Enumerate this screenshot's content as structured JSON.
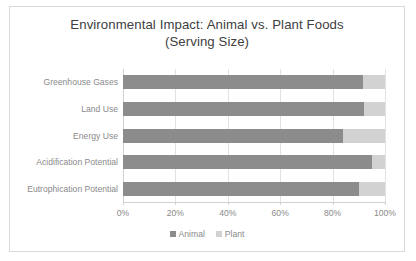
{
  "chart_data": {
    "type": "bar",
    "orientation": "horizontal",
    "stacked": true,
    "stack_mode": "percent",
    "title": "Environmental Impact: Animal vs. Plant Foods (Serving Size)",
    "title_lines": [
      "Environmental Impact: Animal vs. Plant Foods",
      "(Serving Size)"
    ],
    "xlabel": "",
    "ylabel": "",
    "xlim": [
      0,
      100
    ],
    "xticks": [
      0,
      20,
      40,
      60,
      80,
      100
    ],
    "xtick_labels": [
      "0%",
      "20%",
      "40%",
      "60%",
      "80%",
      "100%"
    ],
    "grid": true,
    "grid_axis": "x",
    "legend_position": "bottom-center",
    "categories": [
      "Greenhouse Gases",
      "Land Use",
      "Energy Use",
      "Acidification Potential",
      "Eutrophication Potential"
    ],
    "series": [
      {
        "name": "Animal",
        "color": "#8c8c8c",
        "values": [
          91.5,
          92,
          84,
          95,
          90
        ]
      },
      {
        "name": "Plant",
        "color": "#d2d2d2",
        "values": [
          8.5,
          8,
          16,
          5,
          10
        ]
      }
    ]
  },
  "colors": {
    "animal": "#8c8c8c",
    "plant": "#d2d2d2",
    "gridline": "#e2e2e2",
    "axis": "#d0d0d0",
    "text": "#8a8a8a",
    "title": "#404040",
    "frame": "#d9d9d9"
  }
}
